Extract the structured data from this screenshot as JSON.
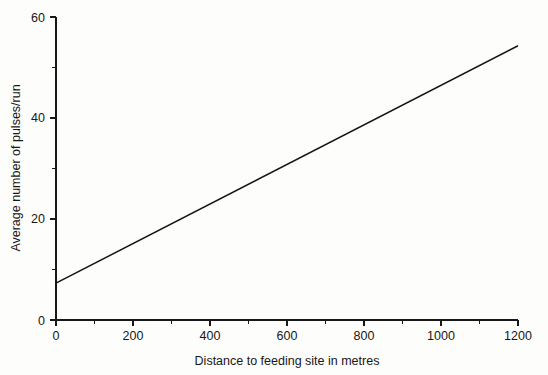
{
  "chart_data": {
    "type": "line",
    "title": "",
    "xlabel": "Distance to feeding site in metres",
    "ylabel": "Average number of pulses/run",
    "xlim": [
      0,
      1200
    ],
    "ylim": [
      0,
      60
    ],
    "grid": false,
    "legend": null,
    "x_major_ticks": [
      0,
      200,
      400,
      600,
      800,
      1000,
      1200
    ],
    "x_minor_ticks": [
      100,
      300,
      500,
      700,
      900,
      1100
    ],
    "y_major_ticks": [
      0,
      20,
      40,
      60
    ],
    "y_minor_ticks": [
      10,
      30,
      50
    ],
    "x_tick_labels": [
      "0",
      "200",
      "400",
      "600",
      "800",
      "1000",
      "1200"
    ],
    "y_tick_labels": [
      "0",
      "20",
      "40",
      "60"
    ],
    "series": [
      {
        "name": "Average number of pulses/run",
        "color": "#141414",
        "x": [
          0,
          1200
        ],
        "values": [
          7.3,
          54.3
        ],
        "intercept": 7.3,
        "slope_per_metre": 0.0392
      }
    ]
  },
  "axes": {
    "x_axis_label": "Distance to feeding site in metres",
    "y_axis_label": "Average number of pulses/run"
  }
}
